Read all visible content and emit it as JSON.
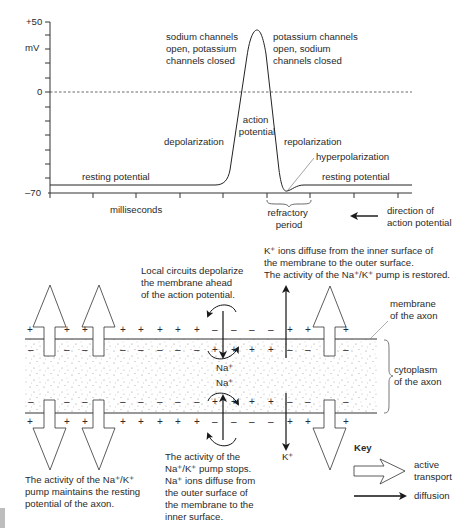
{
  "graph": {
    "y_ticks": {
      "top": "+50",
      "unit": "mV",
      "zero": "0",
      "bottom": "–70"
    },
    "x_label": "milliseconds",
    "labels": {
      "sodium_open": [
        "sodium channels",
        "open, potassium",
        "channels closed"
      ],
      "potassium_open": [
        "potassium channels",
        "open, sodium",
        "channels closed"
      ],
      "depolarization": "depolarization",
      "action_potential": [
        "action",
        "potential"
      ],
      "repolarization": "repolarization",
      "hyperpolarization": "hyperpolarization",
      "resting_left": "resting potential",
      "resting_right": "resting potential",
      "refractory": [
        "refractory",
        "period"
      ],
      "direction": [
        "direction of",
        "action potential"
      ]
    }
  },
  "axon": {
    "top_note": [
      "K⁺ ions diffuse from the inner surface of",
      "the membrane to the outer surface.",
      "The activity of the Na⁺/K⁺ pump is restored."
    ],
    "local_circuits": [
      "Local circuits depolarize",
      "the membrane ahead",
      "of the action potential."
    ],
    "membrane_label": [
      "membrane",
      "of the axon"
    ],
    "cytoplasm_label": [
      "cytoplasm",
      "of the axon"
    ],
    "na_ion_top": "Na⁺",
    "na_ion_bottom": "Na⁺",
    "k_ion": "K⁺",
    "pump_maintains": [
      "The activity of the Na⁺/K⁺",
      "pump maintains the resting",
      "potential of the axon."
    ],
    "pump_stops": [
      "The activity of the",
      "Na⁺/K⁺ pump stops.",
      "Na⁺ ions diffuse from",
      "the outer surface of",
      "the membrane to the",
      "inner surface."
    ]
  },
  "key": {
    "title": "Key",
    "active_transport": [
      "active",
      "transport"
    ],
    "diffusion": "diffusion"
  }
}
